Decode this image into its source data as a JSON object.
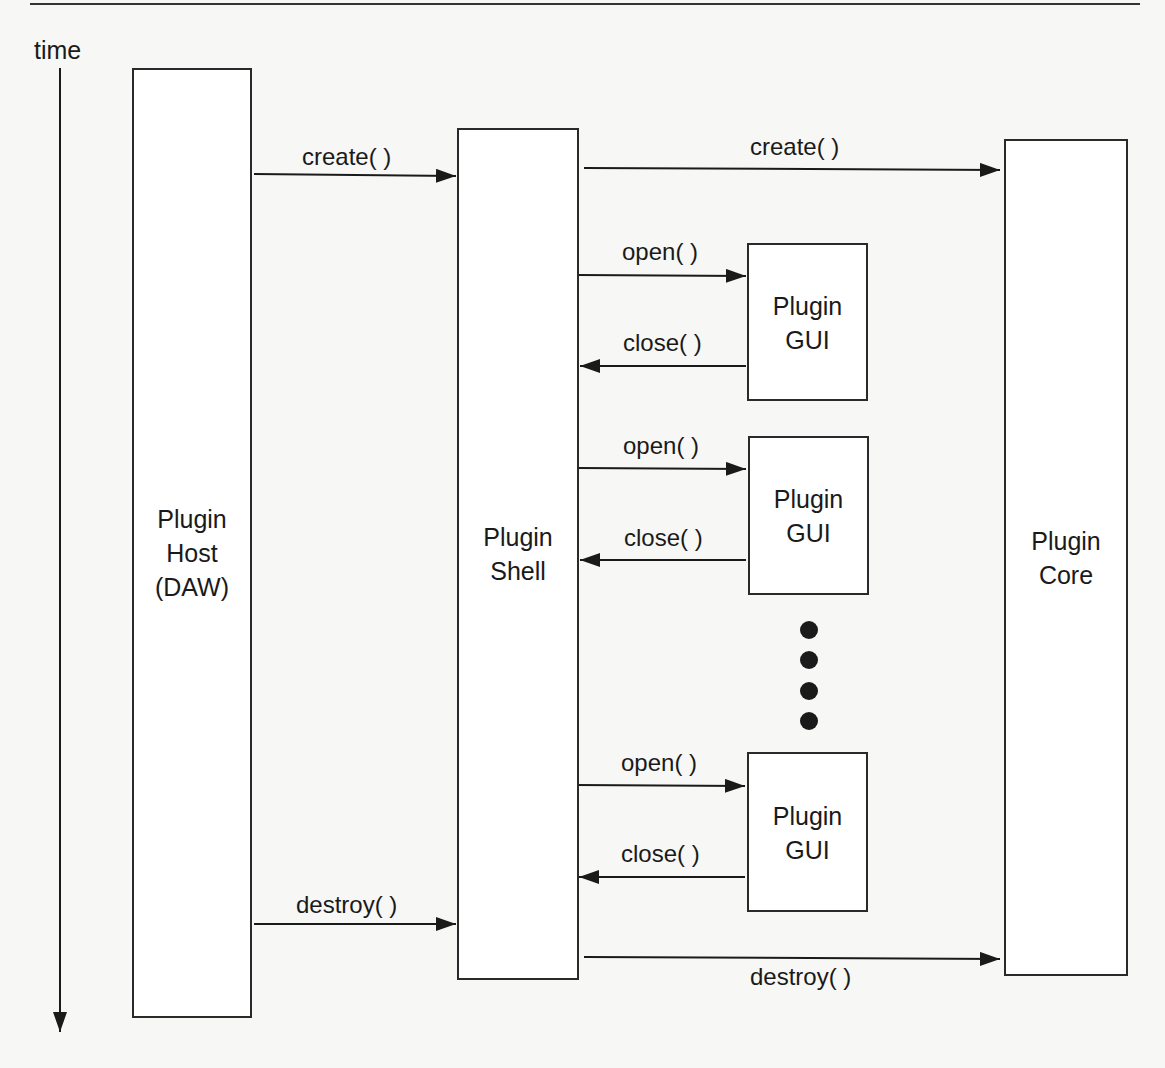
{
  "time_axis": {
    "label": "time"
  },
  "lifelines": {
    "host": {
      "label": "Plugin\nHost\n(DAW)"
    },
    "shell": {
      "label": "Plugin\nShell"
    },
    "core": {
      "label": "Plugin\nCore"
    }
  },
  "gui_boxes": [
    {
      "label": "Plugin\nGUI"
    },
    {
      "label": "Plugin\nGUI"
    },
    {
      "label": "Plugin\nGUI"
    }
  ],
  "messages": {
    "host_create": "create( )",
    "shell_create": "create( )",
    "open_1": "open( )",
    "close_1": "close( )",
    "open_2": "open( )",
    "close_2": "close( )",
    "open_3": "open( )",
    "close_3": "close( )",
    "host_destroy": "destroy( )",
    "shell_destroy": "destroy( )"
  },
  "ellipsis": {
    "count": 4
  }
}
